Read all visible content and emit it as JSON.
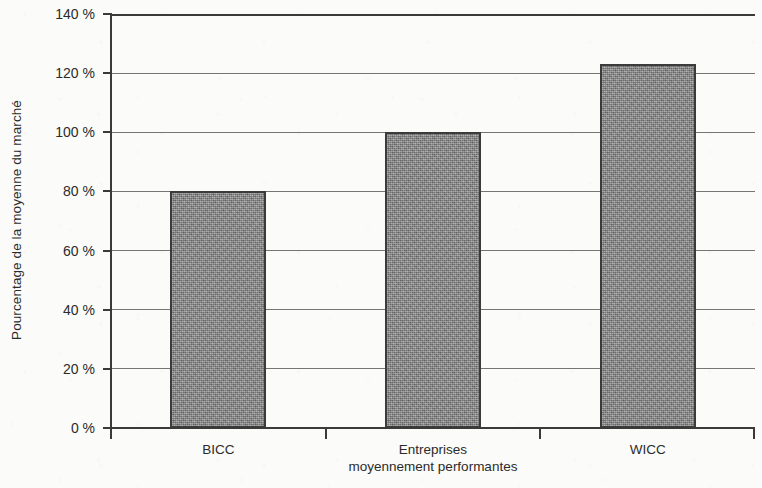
{
  "chart_data": {
    "type": "bar",
    "title": "",
    "xlabel": "",
    "ylabel": "Pourcentage de la moyenne du marché",
    "categories": [
      "BICC",
      "Entreprises\nmoyennement performantes",
      "WICC"
    ],
    "values": [
      80,
      100,
      123
    ],
    "value_unit": "%",
    "ylim": [
      0,
      140
    ],
    "ytick_values": [
      0,
      20,
      40,
      60,
      80,
      100,
      120,
      140
    ],
    "ytick_labels": [
      "0 %",
      "20 %",
      "40 %",
      "60 %",
      "80 %",
      "100 %",
      "120 %",
      "140 %"
    ],
    "grid": "horizontal",
    "legend": "none",
    "series": [
      {
        "name": "Pourcentage de la moyenne du marché",
        "values": [
          80,
          100,
          123
        ]
      }
    ],
    "colors": {
      "bar_fill": "#8b8b8b",
      "bar_border": "#3b3b3b",
      "gridline": "#5d5d5d",
      "axis": "#3a3a3a",
      "background": "#fbfbf9",
      "text": "#2b2b2b"
    }
  }
}
